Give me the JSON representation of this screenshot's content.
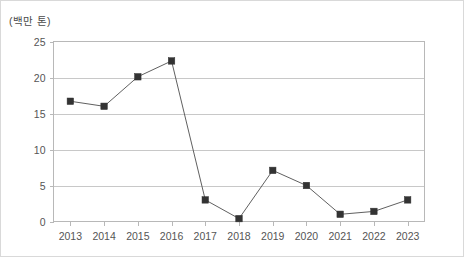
{
  "unit_label": "(백만 톤)",
  "axis": {
    "y_ticks": [
      "0",
      "5",
      "10",
      "15",
      "20",
      "25"
    ],
    "x_ticks": [
      "2013",
      "2014",
      "2015",
      "2016",
      "2017",
      "2018",
      "2019",
      "2020",
      "2021",
      "2022",
      "2023"
    ]
  },
  "colors": {
    "marker": "#333333",
    "line": "#606060",
    "grid": "#c8c8c8",
    "frame": "#b8b8b8",
    "text": "#555555",
    "background": "#ffffff"
  },
  "chart_data": {
    "type": "line",
    "title": "",
    "subtitle": "",
    "xlabel": "",
    "ylabel": "(백만 톤)",
    "categories": [
      "2013",
      "2014",
      "2015",
      "2016",
      "2017",
      "2018",
      "2019",
      "2020",
      "2021",
      "2022",
      "2023"
    ],
    "values": [
      16.7,
      16.0,
      20.1,
      22.3,
      3.0,
      0.4,
      7.1,
      5.0,
      1.0,
      1.4,
      3.0
    ],
    "series": [
      {
        "name": "",
        "values": [
          16.7,
          16.0,
          20.1,
          22.3,
          3.0,
          0.4,
          7.1,
          5.0,
          1.0,
          1.4,
          3.0
        ]
      }
    ],
    "ylim": [
      0,
      25
    ],
    "ytick_values": [
      0,
      5,
      10,
      15,
      20,
      25
    ],
    "grid": "horizontal",
    "legend": "none",
    "marker_style": "square",
    "annotations": []
  }
}
